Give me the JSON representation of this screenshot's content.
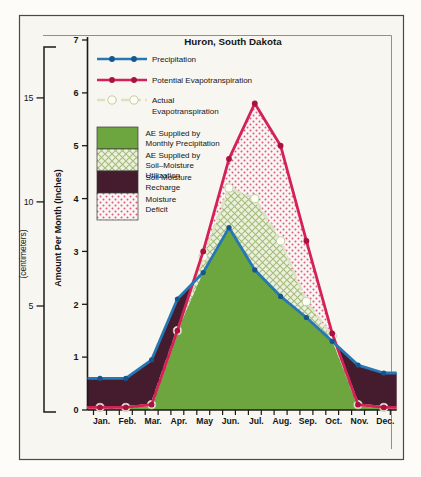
{
  "title": "Huron, South Dakota",
  "axes": {
    "y_inches_label": "Amount Per Month (Inches)",
    "y_cm_label": "(centimeters)",
    "inch_ticks": [
      0,
      1,
      2,
      3,
      4,
      5,
      6,
      7
    ],
    "cm_ticks": [
      5,
      10,
      15
    ],
    "months": [
      "Jan.",
      "Feb.",
      "Mar.",
      "Apr.",
      "May",
      "Jun.",
      "Jul.",
      "Aug.",
      "Sep.",
      "Oct.",
      "Nov.",
      "Dec."
    ]
  },
  "legend": {
    "line_items": [
      {
        "id": "precipitation",
        "label_lines": [
          "Precipitation"
        ],
        "style": "solid-line-dots",
        "color": "#2678b5"
      },
      {
        "id": "potential-evapotranspiration",
        "label_lines": [
          "Potential Evapotranspiration"
        ],
        "style": "solid-line-dots",
        "color": "#d42158"
      },
      {
        "id": "actual-evapotranspiration",
        "label_lines": [
          "Actual",
          "Evapotranspiration"
        ],
        "style": "dashed-line-circles",
        "color": "#dce3c5"
      }
    ],
    "area_items": [
      {
        "id": "ae-monthly-precipitation",
        "label_lines": [
          "AE Supplied by",
          "Monthly Precipitation"
        ],
        "fill": "solid-green"
      },
      {
        "id": "ae-soil-moisture-utilization",
        "label_lines": [
          "AE Supplied by",
          "Soil–Moisture",
          "Utilization"
        ],
        "fill": "green-crosshatch"
      },
      {
        "id": "soil-moisture-recharge",
        "label_lines": [
          "Soil Moisture",
          "Recharge"
        ],
        "fill": "dark-maroon"
      },
      {
        "id": "moisture-deficit",
        "label_lines": [
          "Moisture",
          "Deficit"
        ],
        "fill": "red-dot-screen"
      }
    ]
  },
  "colors": {
    "precip_line": "#2678b5",
    "precip_dot": "#15578c",
    "pe_line": "#d42158",
    "pe_dot": "#a81242",
    "ae_line": "#dce3c5",
    "ae_circle_stroke": "#c3cfa2",
    "green_fill": "#6da63f",
    "maroon_fill": "#441c2e",
    "hatch_bg": "#edf0dd",
    "hatch_line": "#a3bd7b",
    "dotpat_bg": "#fdf4f4",
    "dotpat_dot": "#d06080",
    "axis": "#1a1a1a",
    "frame_outer": "#4a4a4a",
    "frame_inner": "#8f8f8f",
    "figure_bg": "#f8f6f0"
  },
  "chart_data": {
    "type": "area",
    "title": "Huron, South Dakota",
    "x": [
      "Jan.",
      "Feb.",
      "Mar.",
      "Apr.",
      "May",
      "Jun.",
      "Jul.",
      "Aug.",
      "Sep.",
      "Oct.",
      "Nov.",
      "Dec."
    ],
    "ylabel": "Amount Per Month (Inches)",
    "ylabel_secondary": "(centimeters)",
    "ylim": [
      0,
      7
    ],
    "y_ticks_inches": [
      0,
      1,
      2,
      3,
      4,
      5,
      6,
      7
    ],
    "y_ticks_centimeters": [
      5,
      10,
      15
    ],
    "grid": false,
    "legend_position": "upper-left",
    "series": [
      {
        "name": "Precipitation",
        "units": "inches",
        "values": [
          0.6,
          0.6,
          0.95,
          2.1,
          2.6,
          3.45,
          2.65,
          2.15,
          1.75,
          1.3,
          0.85,
          0.7
        ]
      },
      {
        "name": "Potential Evapotranspiration",
        "units": "inches",
        "values": [
          0.05,
          0.05,
          0.1,
          1.5,
          3.0,
          4.75,
          5.8,
          5.0,
          3.2,
          1.45,
          0.1,
          0.05
        ]
      },
      {
        "name": "Actual Evapotranspiration",
        "units": "inches",
        "values": [
          0.05,
          0.05,
          0.1,
          1.5,
          2.9,
          4.2,
          4.0,
          3.2,
          2.05,
          1.4,
          0.1,
          0.05
        ]
      }
    ],
    "regions": [
      {
        "name": "AE Supplied by Monthly Precipitation",
        "between": "0 and min(Precipitation, Potential Evapotranspiration)",
        "fill": "solid-green"
      },
      {
        "name": "AE Supplied by Soil-Moisture Utilization",
        "between": "Precipitation and Actual Evapotranspiration",
        "fill": "green-crosshatch"
      },
      {
        "name": "Soil Moisture Recharge",
        "between": "Potential Evapotranspiration and Precipitation",
        "fill": "dark-maroon"
      },
      {
        "name": "Moisture Deficit",
        "between": "Actual Evapotranspiration and Potential Evapotranspiration",
        "fill": "red-dot-screen"
      }
    ]
  }
}
